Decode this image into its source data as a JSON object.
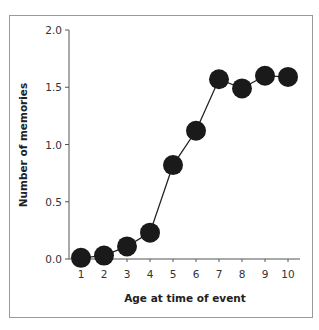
{
  "chart_data": {
    "type": "line",
    "title": "",
    "xlabel": "Age at time of event",
    "ylabel": "Number of memories",
    "x": [
      1,
      2,
      3,
      4,
      5,
      6,
      7,
      8,
      9,
      10
    ],
    "series": [
      {
        "name": "Number of memories",
        "values": [
          0.01,
          0.03,
          0.11,
          0.23,
          0.82,
          1.12,
          1.57,
          1.49,
          1.6,
          1.59
        ]
      }
    ],
    "xticks": [
      "1",
      "2",
      "3",
      "4",
      "5",
      "6",
      "7",
      "8",
      "9",
      "10"
    ],
    "yticks": [
      "0.0",
      "0.5",
      "1.0",
      "1.5",
      "2.0"
    ],
    "ylim": [
      0,
      2.0
    ],
    "xlim": [
      1,
      10
    ],
    "grid": false,
    "legend": "none",
    "marker": "filled-circle",
    "colors": {
      "line": "#222222",
      "marker": "#1a1a1a",
      "frame": "#9a9a9a",
      "axis": "#555555"
    }
  }
}
